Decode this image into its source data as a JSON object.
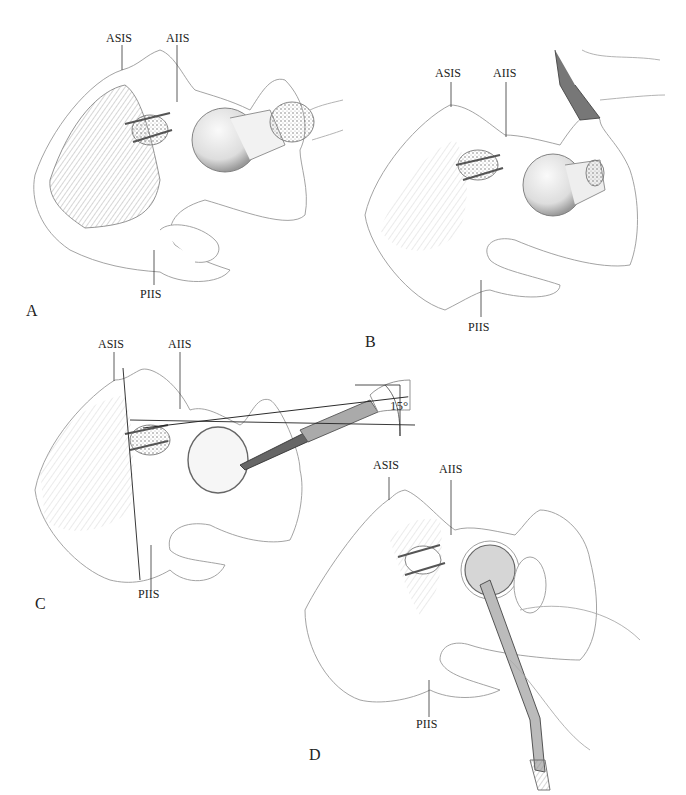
{
  "figure": {
    "panels": [
      {
        "id": "A",
        "letter": "A",
        "labels": {
          "asis": "ASIS",
          "aiis": "AIIS",
          "piis": "PIIS"
        }
      },
      {
        "id": "B",
        "letter": "B",
        "labels": {
          "asis": "ASIS",
          "aiis": "AIIS",
          "piis": "PIIS"
        }
      },
      {
        "id": "C",
        "letter": "C",
        "labels": {
          "asis": "ASIS",
          "aiis": "AIIS",
          "piis": "PIIS"
        },
        "angle": "15°"
      },
      {
        "id": "D",
        "letter": "D",
        "labels": {
          "asis": "ASIS",
          "aiis": "AIIS",
          "piis": "PIIS"
        }
      }
    ]
  }
}
